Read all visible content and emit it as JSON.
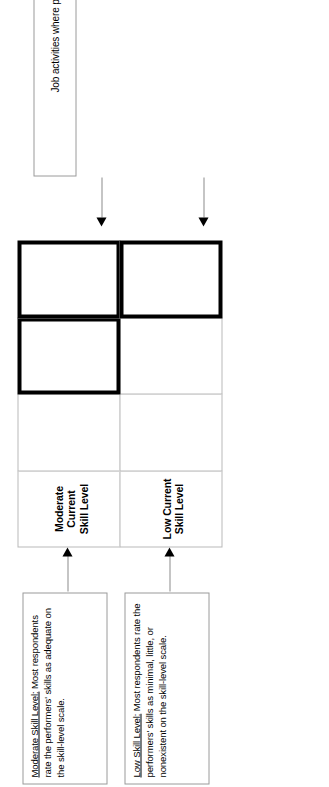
{
  "diagram": {
    "type": "skill-level-matrix",
    "grid": {
      "columns": 4,
      "rows": 2,
      "row_labels": [
        "Moderate Current Skill Level",
        "Low Current Skill Level"
      ],
      "heavy_outlined_cells": [
        {
          "row": 0,
          "col": 2
        },
        {
          "row": 0,
          "col": 3
        },
        {
          "row": 1,
          "col": 3
        }
      ]
    },
    "cells": [
      {
        "row": 0,
        "col": 0,
        "label": "Moderate Current Skill Level",
        "heavy": false,
        "text": ""
      },
      {
        "row": 0,
        "col": 1,
        "label": "",
        "heavy": false,
        "text": ""
      },
      {
        "row": 0,
        "col": 2,
        "label": "",
        "heavy": true,
        "text": ""
      },
      {
        "row": 0,
        "col": 3,
        "label": "",
        "heavy": true,
        "text": ""
      },
      {
        "row": 1,
        "col": 0,
        "label": "Low Current Skill Level",
        "heavy": false,
        "text": ""
      },
      {
        "row": 1,
        "col": 1,
        "label": "",
        "heavy": false,
        "text": ""
      },
      {
        "row": 1,
        "col": 2,
        "label": "",
        "heavy": false,
        "text": ""
      },
      {
        "row": 1,
        "col": 3,
        "label": "",
        "heavy": true,
        "text": ""
      }
    ]
  },
  "row_labels": {
    "moderate": "Moderate\nCurrent\nSkill Level",
    "moderate_line1": "Moderate",
    "moderate_line2": "Current",
    "moderate_line3": "Skill Level",
    "low_line1": "Low Current",
    "low_line2": "Skill Level"
  },
  "callouts": [
    {
      "id": "moderate-skill-level",
      "heading": "Moderate Skill Level:",
      "body": "Most respondents rate the performers' skills as adequate on the skill-level scale.",
      "full": "Moderate Skill Level: Most respondents rate the performers' skills as adequate on the skill-level scale."
    },
    {
      "id": "low-skill-level",
      "heading": "Low Skill Level:",
      "body": "Most respondents rate the performers' skills as minimal, little, or nonexistent on the skill-level scale.",
      "full": "Low Skill Level: Most respondents rate the performers' skills as minimal, little, or nonexistent on the skill-level scale."
    }
  ],
  "note": {
    "text": "Job activities where performers require training are shown within the heavy lines."
  },
  "colors": {
    "heavy_line": "#000000",
    "light_line": "#b9b9b9",
    "box_border": "#9a9a9a",
    "connector": "#8c8c8c",
    "background": "#ffffff"
  }
}
